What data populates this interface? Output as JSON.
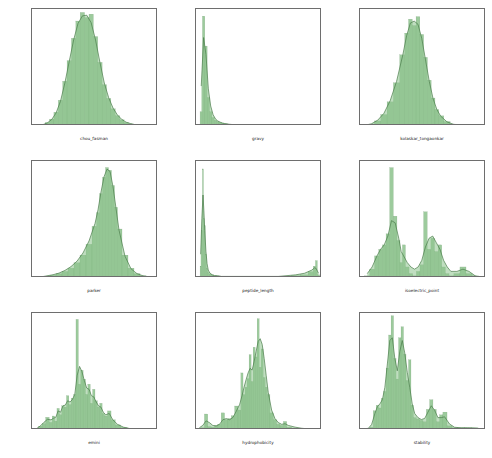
{
  "figure": {
    "kind": "histogram-grid",
    "rows": 3,
    "cols": 3,
    "background": "#ffffff",
    "fill_color": "#8cc28c",
    "line_color": "#4a7c4a",
    "axis_color": "#6e6e6e"
  },
  "chart_data": [
    {
      "type": "bar",
      "id": "chou_fasman",
      "title": "",
      "xlabel": "chou_fasman",
      "ylabel": "",
      "grid": false,
      "legend": null,
      "xlim": [
        0.5,
        1.65
      ],
      "ylim": [
        0.0,
        3.4
      ],
      "xticks": [
        "0.6",
        "0.8",
        "1.0",
        "1.2",
        "1.4",
        "1.6"
      ],
      "xtickvals": [
        0.6,
        0.8,
        1.0,
        1.2,
        1.4,
        1.6
      ],
      "yticks": [
        "0.0",
        "0.5",
        "1.0",
        "1.5",
        "2.0",
        "2.5",
        "3.0"
      ],
      "ytickvals": [
        0.0,
        0.5,
        1.0,
        1.5,
        2.0,
        2.5,
        3.0
      ],
      "categories": [
        0.56,
        0.6,
        0.64,
        0.68,
        0.72,
        0.76,
        0.8,
        0.84,
        0.88,
        0.92,
        0.96,
        1.0,
        1.04,
        1.08,
        1.12,
        1.16,
        1.2,
        1.24,
        1.28,
        1.32,
        1.36,
        1.4,
        1.44,
        1.48,
        1.52,
        1.56,
        1.6
      ],
      "values": [
        0.02,
        0.05,
        0.1,
        0.2,
        0.4,
        0.75,
        1.3,
        1.9,
        2.55,
        3.05,
        3.3,
        3.15,
        3.25,
        2.6,
        1.85,
        1.2,
        0.8,
        0.5,
        0.3,
        0.18,
        0.1,
        0.06,
        0.04,
        0.02,
        0.01,
        0.01,
        0.0
      ],
      "kde": [
        0.01,
        0.04,
        0.09,
        0.19,
        0.38,
        0.72,
        1.25,
        1.88,
        2.5,
        2.98,
        3.2,
        3.22,
        3.0,
        2.5,
        1.85,
        1.25,
        0.82,
        0.52,
        0.32,
        0.19,
        0.11,
        0.07,
        0.04,
        0.02,
        0.01,
        0.0,
        0.0
      ]
    },
    {
      "type": "bar",
      "id": "gravy",
      "title": "",
      "xlabel": "gravy",
      "ylabel": "",
      "grid": false,
      "legend": null,
      "xlim": [
        -2,
        46
      ],
      "ylim": [
        0.0,
        0.82
      ],
      "xticks": [
        "0",
        "10",
        "20",
        "30",
        "40"
      ],
      "xtickvals": [
        0,
        10,
        20,
        30,
        40
      ],
      "yticks": [
        "0.0",
        "0.1",
        "0.2",
        "0.3",
        "0.4",
        "0.5",
        "0.6",
        "0.7",
        "0.8"
      ],
      "ytickvals": [
        0.0,
        0.1,
        0.2,
        0.3,
        0.4,
        0.5,
        0.6,
        0.7,
        0.8
      ],
      "categories": [
        0.0,
        0.9,
        1.8,
        2.7,
        3.6,
        4.5,
        5.4,
        6.3,
        7.2,
        8.1,
        9.0,
        10.8,
        12.6,
        14.4,
        16.2,
        18.0,
        21.0,
        24.0,
        27.0,
        30.0,
        33.0,
        36.0,
        39.0,
        42.0,
        45.0
      ],
      "values": [
        0.1,
        0.77,
        0.56,
        0.2,
        0.1,
        0.06,
        0.04,
        0.03,
        0.025,
        0.02,
        0.015,
        0.01,
        0.008,
        0.006,
        0.005,
        0.004,
        0.003,
        0.002,
        0.002,
        0.001,
        0.001,
        0.001,
        0.001,
        0.001,
        0.001
      ],
      "kde": [
        0.28,
        0.62,
        0.5,
        0.26,
        0.14,
        0.08,
        0.05,
        0.035,
        0.027,
        0.021,
        0.017,
        0.012,
        0.009,
        0.007,
        0.006,
        0.005,
        0.004,
        0.003,
        0.002,
        0.002,
        0.001,
        0.001,
        0.001,
        0.001,
        0.0
      ]
    },
    {
      "type": "bar",
      "id": "kolaskar_tongaonkar",
      "title": "",
      "xlabel": "kolaskar_tongaonkar",
      "ylabel": "",
      "grid": false,
      "legend": null,
      "xlim": [
        0.8,
        1.3
      ],
      "ylim": [
        0.0,
        9.2
      ],
      "xticks": [
        "0.8",
        "0.9",
        "1.0",
        "1.1",
        "1.2",
        "1.3"
      ],
      "xtickvals": [
        0.8,
        0.9,
        1.0,
        1.1,
        1.2,
        1.3
      ],
      "yticks": [
        "0",
        "2",
        "4",
        "6",
        "8"
      ],
      "ytickvals": [
        0,
        2,
        4,
        6,
        8
      ],
      "categories": [
        0.82,
        0.845,
        0.87,
        0.895,
        0.92,
        0.945,
        0.97,
        0.985,
        1.0,
        1.015,
        1.03,
        1.045,
        1.06,
        1.075,
        1.09,
        1.105,
        1.12,
        1.145,
        1.17,
        1.195,
        1.22,
        1.25,
        1.28
      ],
      "values": [
        0.05,
        0.15,
        0.4,
        0.9,
        1.9,
        3.4,
        5.6,
        7.3,
        8.4,
        7.9,
        8.6,
        7.2,
        5.4,
        3.6,
        2.2,
        1.3,
        0.8,
        0.35,
        0.15,
        0.07,
        0.03,
        0.01,
        0.0
      ],
      "kde": [
        0.06,
        0.17,
        0.45,
        1.0,
        2.0,
        3.5,
        5.6,
        7.1,
        8.1,
        8.25,
        8.0,
        6.9,
        5.2,
        3.5,
        2.15,
        1.3,
        0.78,
        0.33,
        0.14,
        0.06,
        0.03,
        0.01,
        0.0
      ]
    },
    {
      "type": "bar",
      "id": "parker",
      "title": "",
      "xlabel": "parker",
      "ylabel": "",
      "grid": false,
      "legend": null,
      "xlim": [
        -10.5,
        10.5
      ],
      "ylim": [
        0.0,
        0.215
      ],
      "xticks": [
        "-10.0",
        "-7.5",
        "-5.0",
        "-2.5",
        "0.0",
        "2.5",
        "5.0",
        "7.5",
        "10.0"
      ],
      "xtickvals": [
        -10.0,
        -7.5,
        -5.0,
        -2.5,
        0.0,
        2.5,
        5.0,
        7.5,
        10.0
      ],
      "yticks": [
        "0.00",
        "0.05",
        "0.10",
        "0.15",
        "0.20"
      ],
      "ytickvals": [
        0.0,
        0.05,
        0.1,
        0.15,
        0.2
      ],
      "categories": [
        -10.0,
        -9.0,
        -8.0,
        -7.0,
        -6.0,
        -5.0,
        -4.0,
        -3.0,
        -2.0,
        -1.0,
        0.0,
        0.5,
        1.0,
        1.5,
        2.0,
        2.5,
        3.0,
        3.5,
        4.0,
        5.0,
        6.0,
        7.0,
        8.0,
        9.0,
        10.0
      ],
      "values": [
        0.001,
        0.002,
        0.003,
        0.005,
        0.008,
        0.012,
        0.018,
        0.028,
        0.042,
        0.062,
        0.095,
        0.12,
        0.155,
        0.185,
        0.203,
        0.198,
        0.17,
        0.13,
        0.09,
        0.042,
        0.018,
        0.008,
        0.004,
        0.002,
        0.001
      ],
      "kde": [
        0.001,
        0.002,
        0.004,
        0.006,
        0.009,
        0.014,
        0.021,
        0.031,
        0.046,
        0.068,
        0.1,
        0.125,
        0.158,
        0.186,
        0.2,
        0.196,
        0.168,
        0.128,
        0.088,
        0.04,
        0.017,
        0.008,
        0.004,
        0.002,
        0.001
      ]
    },
    {
      "type": "bar",
      "id": "peptide_length",
      "title": "",
      "xlabel": "peptide_length",
      "ylabel": "",
      "grid": false,
      "legend": null,
      "xlim": [
        -12,
        420
      ],
      "ylim": [
        0.0,
        0.148
      ],
      "xticks": [
        "0",
        "50",
        "100",
        "150",
        "200",
        "250",
        "300",
        "350",
        "400"
      ],
      "xtickvals": [
        0,
        50,
        100,
        150,
        200,
        250,
        300,
        350,
        400
      ],
      "yticks": [
        "0.00",
        "0.02",
        "0.04",
        "0.06",
        "0.08",
        "0.10",
        "0.12",
        "0.14"
      ],
      "ytickvals": [
        0.0,
        0.02,
        0.04,
        0.06,
        0.08,
        0.1,
        0.12,
        0.14
      ],
      "categories": [
        4,
        8,
        12,
        15,
        18,
        22,
        26,
        30,
        36,
        44,
        52,
        62,
        75,
        95,
        120,
        150,
        180,
        210,
        240,
        270,
        300,
        330,
        360,
        385,
        395,
        400,
        408
      ],
      "values": [
        0.015,
        0.06,
        0.138,
        0.075,
        0.066,
        0.03,
        0.012,
        0.007,
        0.005,
        0.004,
        0.003,
        0.002,
        0.002,
        0.002,
        0.002,
        0.002,
        0.002,
        0.002,
        0.002,
        0.002,
        0.002,
        0.003,
        0.004,
        0.008,
        0.015,
        0.022,
        0.004
      ],
      "kde": [
        0.03,
        0.075,
        0.105,
        0.085,
        0.06,
        0.034,
        0.018,
        0.01,
        0.006,
        0.004,
        0.003,
        0.003,
        0.002,
        0.002,
        0.002,
        0.002,
        0.002,
        0.002,
        0.002,
        0.002,
        0.003,
        0.004,
        0.006,
        0.01,
        0.013,
        0.012,
        0.006
      ]
    },
    {
      "type": "bar",
      "id": "isoelectric_point",
      "title": "",
      "xlabel": "isoelectric_point",
      "ylabel": "",
      "grid": false,
      "legend": null,
      "xlim": [
        2.6,
        13.0
      ],
      "ylim": [
        0.0,
        0.53
      ],
      "xticks": [
        "4",
        "6",
        "8",
        "10",
        "12"
      ],
      "xtickvals": [
        4,
        6,
        8,
        10,
        12
      ],
      "yticks": [
        "0.0",
        "0.1",
        "0.2",
        "0.3",
        "0.4",
        "0.5"
      ],
      "ytickvals": [
        0.0,
        0.1,
        0.2,
        0.3,
        0.4,
        0.5
      ],
      "categories": [
        3.2,
        3.6,
        4.0,
        4.3,
        4.6,
        4.9,
        5.2,
        5.5,
        5.8,
        6.0,
        6.2,
        6.5,
        6.8,
        7.1,
        7.4,
        7.7,
        8.0,
        8.3,
        8.6,
        8.9,
        9.2,
        9.5,
        9.8,
        10.1,
        10.6,
        11.1,
        11.6,
        12.1,
        12.6
      ],
      "values": [
        0.01,
        0.04,
        0.1,
        0.13,
        0.15,
        0.2,
        0.5,
        0.28,
        0.17,
        0.07,
        0.15,
        0.05,
        0.02,
        0.01,
        0.03,
        0.06,
        0.3,
        0.13,
        0.18,
        0.12,
        0.15,
        0.05,
        0.02,
        0.01,
        0.02,
        0.05,
        0.02,
        0.01,
        0.0
      ],
      "kde": [
        0.02,
        0.05,
        0.1,
        0.13,
        0.15,
        0.19,
        0.26,
        0.25,
        0.18,
        0.12,
        0.1,
        0.07,
        0.05,
        0.04,
        0.05,
        0.08,
        0.14,
        0.18,
        0.19,
        0.16,
        0.13,
        0.08,
        0.05,
        0.03,
        0.03,
        0.04,
        0.03,
        0.01,
        0.0
      ]
    },
    {
      "type": "bar",
      "id": "emini",
      "title": "",
      "xlabel": "emini",
      "ylabel": "",
      "grid": false,
      "legend": null,
      "xlim": [
        -0.006,
        0.206
      ],
      "ylim": [
        0.0,
        46.0
      ],
      "xticks": [
        "0.000",
        "0.025",
        "0.050",
        "0.075",
        "0.100",
        "0.125",
        "0.150",
        "0.175",
        "0.200"
      ],
      "xtickvals": [
        0.0,
        0.025,
        0.05,
        0.075,
        0.1,
        0.125,
        0.15,
        0.175,
        0.2
      ],
      "yticks": [
        "0",
        "10",
        "20",
        "30",
        "40"
      ],
      "ytickvals": [
        0,
        10,
        20,
        30,
        40
      ],
      "categories": [
        0.002,
        0.008,
        0.014,
        0.02,
        0.026,
        0.03,
        0.034,
        0.038,
        0.042,
        0.046,
        0.05,
        0.054,
        0.058,
        0.062,
        0.066,
        0.07,
        0.074,
        0.078,
        0.082,
        0.086,
        0.09,
        0.094,
        0.098,
        0.102,
        0.106,
        0.11,
        0.114,
        0.118,
        0.124,
        0.13,
        0.138,
        0.148,
        0.16,
        0.18
      ],
      "values": [
        0.5,
        1.5,
        2.5,
        5.0,
        3.0,
        5.5,
        3.5,
        8.5,
        6.0,
        9.5,
        9.0,
        13.5,
        10.0,
        12.5,
        14.0,
        43.5,
        18.0,
        23.5,
        20.0,
        14.0,
        18.0,
        10.5,
        16.0,
        11.5,
        9.0,
        10.5,
        6.5,
        5.5,
        7.5,
        4.0,
        2.0,
        1.0,
        0.5,
        0.2
      ],
      "kde": [
        0.6,
        1.6,
        3.0,
        4.2,
        4.0,
        4.6,
        5.0,
        7.5,
        7.0,
        9.5,
        9.8,
        11.5,
        11.0,
        12.0,
        14.0,
        21.5,
        25.0,
        23.0,
        19.5,
        16.5,
        16.0,
        13.5,
        13.0,
        11.0,
        9.5,
        9.0,
        7.0,
        6.0,
        6.5,
        4.0,
        2.2,
        1.1,
        0.5,
        0.2
      ]
    },
    {
      "type": "bar",
      "id": "hydrophobicity",
      "title": "",
      "xlabel": "hydrophobicity",
      "ylabel": "",
      "grid": false,
      "legend": null,
      "xlim": [
        -2.15,
        1.6
      ],
      "ylim": [
        0.0,
        2.05
      ],
      "xticks": [
        "-2.0",
        "-1.5",
        "-1.0",
        "-0.5",
        "0.0",
        "0.5",
        "1.0",
        "1.5"
      ],
      "xtickvals": [
        -2.0,
        -1.5,
        -1.0,
        -0.5,
        0.0,
        0.5,
        1.0,
        1.5
      ],
      "yticks": [
        "0.00",
        "0.25",
        "0.50",
        "0.75",
        "1.00",
        "1.25",
        "1.50",
        "1.75",
        "2.00"
      ],
      "ytickvals": [
        0.0,
        0.25,
        0.5,
        0.75,
        1.0,
        1.25,
        1.5,
        1.75,
        2.0
      ],
      "categories": [
        -2.05,
        -1.95,
        -1.85,
        -1.75,
        -1.65,
        -1.55,
        -1.45,
        -1.35,
        -1.25,
        -1.15,
        -1.05,
        -0.95,
        -0.85,
        -0.78,
        -0.72,
        -0.66,
        -0.6,
        -0.54,
        -0.48,
        -0.42,
        -0.36,
        -0.3,
        -0.24,
        -0.18,
        -0.12,
        -0.06,
        0.0,
        0.1,
        0.2,
        0.3,
        0.4,
        0.5,
        0.6,
        0.8,
        1.0,
        1.2,
        1.45
      ],
      "values": [
        0.03,
        0.04,
        0.28,
        0.06,
        0.05,
        0.08,
        0.1,
        0.3,
        0.18,
        0.2,
        0.25,
        0.42,
        0.35,
        1.0,
        0.62,
        0.75,
        0.9,
        1.32,
        0.85,
        1.45,
        1.28,
        1.95,
        1.1,
        1.42,
        0.92,
        0.75,
        0.62,
        0.3,
        0.18,
        0.1,
        0.08,
        0.15,
        0.05,
        0.03,
        0.02,
        0.02,
        0.01
      ],
      "kde": [
        0.04,
        0.08,
        0.16,
        0.13,
        0.08,
        0.07,
        0.1,
        0.18,
        0.2,
        0.18,
        0.22,
        0.33,
        0.45,
        0.6,
        0.75,
        0.88,
        1.0,
        1.08,
        1.05,
        1.2,
        1.38,
        1.55,
        1.6,
        1.5,
        1.25,
        0.95,
        0.66,
        0.35,
        0.2,
        0.13,
        0.1,
        0.11,
        0.08,
        0.05,
        0.03,
        0.02,
        0.01
      ]
    },
    {
      "type": "bar",
      "id": "stability",
      "title": "",
      "xlabel": "stability",
      "ylabel": "",
      "grid": false,
      "legend": null,
      "xlim": [
        -4,
        148
      ],
      "ylim": [
        0.0,
        0.0425
      ],
      "xticks": [
        "0",
        "20",
        "40",
        "60",
        "80",
        "100",
        "120",
        "140"
      ],
      "xtickvals": [
        0,
        20,
        40,
        60,
        80,
        100,
        120,
        140
      ],
      "yticks": [
        "0.000",
        "0.005",
        "0.010",
        "0.015",
        "0.020",
        "0.025",
        "0.030",
        "0.035",
        "0.040"
      ],
      "ytickvals": [
        0.0,
        0.005,
        0.01,
        0.015,
        0.02,
        0.025,
        0.03,
        0.035,
        0.04
      ],
      "categories": [
        2,
        6,
        10,
        14,
        17,
        20,
        23,
        26,
        29,
        32,
        35,
        38,
        41,
        44,
        47,
        50,
        53,
        56,
        59,
        62,
        66,
        70,
        74,
        78,
        82,
        86,
        90,
        94,
        98,
        104,
        110,
        118,
        126,
        134,
        142
      ],
      "values": [
        0.0005,
        0.0005,
        0.001,
        0.007,
        0.009,
        0.008,
        0.0115,
        0.014,
        0.0225,
        0.0345,
        0.0415,
        0.026,
        0.0185,
        0.0335,
        0.0375,
        0.0275,
        0.018,
        0.0255,
        0.009,
        0.0045,
        0.004,
        0.0035,
        0.003,
        0.0075,
        0.011,
        0.0075,
        0.003,
        0.0055,
        0.0065,
        0.0015,
        0.0008,
        0.0008,
        0.0008,
        0.0008,
        0.0005
      ],
      "kde": [
        0.0005,
        0.0006,
        0.002,
        0.006,
        0.0085,
        0.0095,
        0.011,
        0.0155,
        0.024,
        0.0325,
        0.0335,
        0.026,
        0.0215,
        0.0285,
        0.0325,
        0.028,
        0.021,
        0.0155,
        0.0095,
        0.006,
        0.0045,
        0.0038,
        0.0042,
        0.0065,
        0.0088,
        0.0072,
        0.0045,
        0.0045,
        0.0048,
        0.0022,
        0.001,
        0.0008,
        0.0008,
        0.0007,
        0.0005
      ]
    }
  ]
}
